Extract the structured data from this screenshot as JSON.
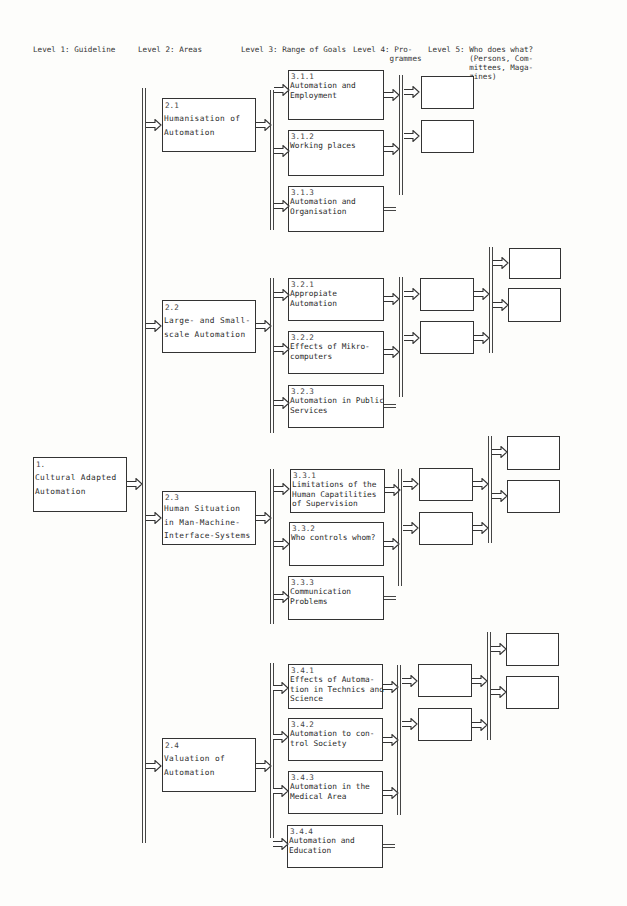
{
  "headers": [
    {
      "label": "Level 1: Guideline",
      "x": 33,
      "y": 45
    },
    {
      "label": "Level 2: Areas",
      "x": 138,
      "y": 45
    },
    {
      "label": "Level 3: Range of Goals",
      "x": 241,
      "y": 45
    },
    {
      "label": "Level 4: Pro-\n        grammes",
      "x": 353,
      "y": 45
    },
    {
      "label": "Level 5: Who does what?\n         (Persons, Com-\n         mittees, Maga-\n         zines)",
      "x": 428,
      "y": 45
    }
  ],
  "level1": {
    "number": "1.",
    "label": "Cultural Adapted\nAutomation"
  },
  "level2": [
    {
      "number": "2.1",
      "label": "Humanisation of\nAutomation"
    },
    {
      "number": "2.2",
      "label": "Large- and Small-\nscale Automation"
    },
    {
      "number": "2.3",
      "label": "Human Situation\nin Man-Machine-\nInterface-Systems"
    },
    {
      "number": "2.4",
      "label": "Valuation of\nAutomation"
    }
  ],
  "level3": [
    {
      "number": "3.1.1",
      "label": "Automation and\nEmployment"
    },
    {
      "number": "3.1.2",
      "label": "Working places"
    },
    {
      "number": "3.1.3",
      "label": "Automation and\nOrganisation"
    },
    {
      "number": "3.2.1",
      "label": "Appropiate\nAutomation"
    },
    {
      "number": "3.2.2",
      "label": "Effects of Mikro-\ncomputers"
    },
    {
      "number": "3.2.3",
      "label": "Automation in Public\nServices"
    },
    {
      "number": "3.3.1",
      "label": "Limitations of the\nHuman Capatilities\nof Supervision"
    },
    {
      "number": "3.3.2",
      "label": "Who controls whom?"
    },
    {
      "number": "3.3.3",
      "label": "Communication\nProblems"
    },
    {
      "number": "3.4.1",
      "label": "Effects of Automa-\ntion in Technics and\nScience"
    },
    {
      "number": "3.4.2",
      "label": "Automation to con-\ntrol Society"
    },
    {
      "number": "3.4.3",
      "label": "Automation in the\nMedical Area"
    },
    {
      "number": "3.4.4",
      "label": "Automation and\nEducation"
    }
  ],
  "colors": {
    "line": "#333333",
    "background": "#fdfdfb",
    "box_fill": "#ffffff"
  }
}
